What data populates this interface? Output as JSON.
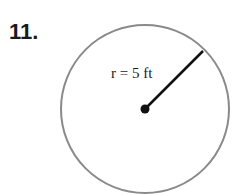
{
  "problem": {
    "number": "11."
  },
  "figure": {
    "shape": "circle",
    "radius_label": "r = 5 ft",
    "radius_variable": "r",
    "radius_value": "5",
    "radius_unit": "ft",
    "colors": {
      "circle_stroke": "#8a8a8a",
      "radius_line": "#111111",
      "center_dot": "#111111"
    }
  }
}
